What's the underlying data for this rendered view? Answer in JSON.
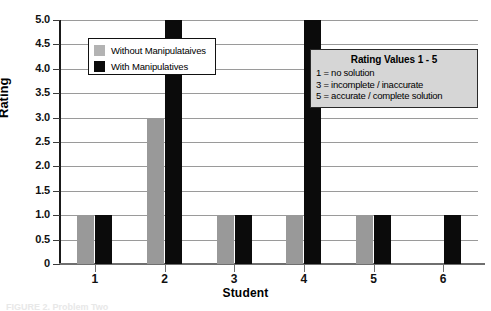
{
  "chart_data": {
    "type": "bar",
    "title": "",
    "xlabel": "Student",
    "ylabel": "Rating",
    "categories": [
      "1",
      "2",
      "3",
      "4",
      "5",
      "6"
    ],
    "series": [
      {
        "name": "Without Manipulataives",
        "color": "#999999",
        "values": [
          1,
          3,
          1,
          1,
          1,
          null
        ]
      },
      {
        "name": "With Manipulatives",
        "color": "#0b0b0b",
        "values": [
          1,
          5,
          1,
          5,
          1,
          1
        ]
      }
    ],
    "ylim": [
      0,
      5
    ],
    "ytick_labels": [
      "0",
      "0.5",
      "1.0",
      "1.5",
      "2.0",
      "2.5",
      "3.0",
      "3.5",
      "4.0",
      "4.5",
      "5.0"
    ],
    "ytick_values": [
      0,
      0.5,
      1.0,
      1.5,
      2.0,
      2.5,
      3.0,
      3.5,
      4.0,
      4.5,
      5.0
    ],
    "grid": true,
    "legend_position": "upper-left-inside"
  },
  "legend": {
    "items": [
      {
        "label": "Without Manipulataives",
        "swatch": "gray"
      },
      {
        "label": "With Manipulatives",
        "swatch": "black"
      }
    ]
  },
  "annotation": {
    "title": "Rating Values 1 - 5",
    "lines": [
      "1 = no solution",
      "3 = incomplete / inaccurate",
      "5 = accurate / complete solution"
    ]
  },
  "caption": {
    "text": "FIGURE 2.  Problem Two"
  }
}
